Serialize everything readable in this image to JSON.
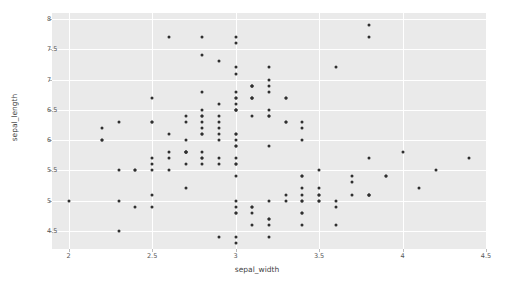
{
  "chart_data": {
    "type": "scatter",
    "title": "",
    "xlabel": "sepal_width",
    "ylabel": "sepal_length",
    "xlim": [
      1.9,
      4.5
    ],
    "ylim": [
      4.2,
      8.1
    ],
    "xticks": [
      "2",
      "2.5",
      "3",
      "3.5",
      "4",
      "4.5"
    ],
    "xtick_values": [
      2,
      2.5,
      3,
      3.5,
      4,
      4.5
    ],
    "yticks": [
      "4.5",
      "5",
      "5.5",
      "6",
      "6.5",
      "7",
      "7.5",
      "8"
    ],
    "ytick_values": [
      4.5,
      5,
      5.5,
      6,
      6.5,
      7,
      7.5,
      8
    ],
    "grid": true,
    "legend": null,
    "marker_color": "#2f2f2f",
    "plot_background": "#eaeaea",
    "grid_color": "#ffffff",
    "x": [
      3.5,
      3.0,
      3.2,
      3.1,
      3.6,
      3.9,
      3.4,
      3.4,
      2.9,
      3.1,
      3.7,
      3.4,
      3.0,
      3.0,
      4.0,
      4.4,
      3.9,
      3.5,
      3.8,
      3.8,
      3.4,
      3.7,
      3.6,
      3.3,
      3.4,
      3.0,
      3.4,
      3.5,
      3.4,
      3.2,
      3.1,
      3.4,
      4.1,
      4.2,
      3.1,
      3.2,
      3.5,
      3.6,
      3.0,
      3.4,
      3.5,
      2.3,
      3.2,
      3.5,
      3.8,
      3.0,
      3.8,
      3.2,
      3.7,
      3.3,
      3.2,
      3.2,
      3.1,
      2.3,
      2.8,
      2.8,
      3.3,
      2.4,
      2.9,
      2.7,
      2.0,
      3.0,
      2.2,
      2.9,
      2.9,
      3.1,
      3.0,
      2.7,
      2.2,
      2.5,
      3.2,
      2.8,
      2.5,
      2.8,
      2.9,
      3.0,
      2.8,
      3.0,
      2.9,
      2.6,
      2.4,
      2.4,
      2.7,
      2.7,
      3.0,
      3.4,
      3.1,
      2.3,
      3.0,
      2.5,
      2.6,
      3.0,
      2.6,
      2.3,
      2.7,
      3.0,
      2.9,
      2.9,
      2.5,
      2.8,
      3.3,
      2.7,
      3.0,
      2.9,
      3.0,
      3.0,
      2.5,
      2.9,
      2.5,
      3.6,
      3.2,
      2.7,
      3.0,
      2.5,
      2.8,
      3.2,
      3.0,
      3.8,
      2.6,
      2.2,
      3.2,
      2.8,
      2.8,
      2.7,
      3.3,
      3.2,
      2.8,
      3.0,
      2.8,
      3.0,
      2.8,
      3.8,
      2.8,
      2.8,
      2.6,
      3.0,
      3.4,
      3.1,
      3.0,
      3.1,
      3.1,
      3.1,
      2.7,
      3.2,
      3.3,
      3.0,
      2.5,
      3.0,
      3.4,
      3.0
    ],
    "y": [
      5.1,
      4.9,
      4.7,
      4.6,
      5.0,
      5.4,
      4.6,
      5.0,
      4.4,
      4.9,
      5.4,
      4.8,
      4.8,
      4.3,
      5.8,
      5.7,
      5.4,
      5.1,
      5.7,
      5.1,
      5.4,
      5.1,
      4.6,
      5.1,
      4.8,
      5.0,
      5.0,
      5.2,
      5.2,
      4.7,
      4.8,
      5.4,
      5.2,
      5.5,
      4.9,
      5.0,
      5.5,
      4.9,
      4.4,
      5.1,
      5.0,
      4.5,
      4.4,
      5.0,
      5.1,
      4.8,
      5.1,
      4.6,
      5.3,
      5.0,
      7.0,
      6.4,
      6.9,
      5.5,
      6.5,
      5.7,
      6.3,
      4.9,
      6.6,
      5.2,
      5.0,
      5.9,
      6.0,
      6.1,
      5.6,
      6.7,
      5.6,
      5.8,
      6.2,
      5.6,
      5.9,
      6.1,
      6.3,
      6.1,
      6.4,
      6.6,
      6.8,
      6.7,
      6.0,
      5.7,
      5.5,
      5.5,
      5.8,
      6.0,
      5.4,
      6.0,
      6.7,
      6.3,
      5.6,
      5.5,
      5.5,
      6.1,
      5.8,
      5.0,
      5.6,
      5.7,
      5.7,
      6.2,
      5.1,
      5.7,
      6.3,
      5.8,
      7.1,
      6.3,
      6.5,
      7.6,
      4.9,
      7.3,
      6.7,
      7.2,
      6.5,
      6.4,
      6.8,
      5.7,
      5.8,
      6.4,
      6.5,
      7.7,
      7.7,
      6.0,
      6.9,
      5.6,
      7.7,
      6.3,
      6.7,
      7.2,
      6.2,
      6.1,
      6.4,
      7.2,
      7.4,
      7.9,
      6.4,
      6.3,
      6.1,
      7.7,
      6.3,
      6.4,
      6.0,
      6.9,
      6.7,
      6.9,
      5.8,
      6.8,
      6.7,
      6.7,
      6.3,
      6.5,
      6.2,
      5.9
    ]
  }
}
